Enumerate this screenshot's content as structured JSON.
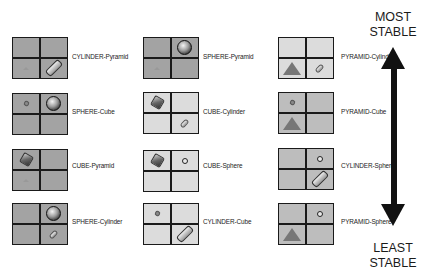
{
  "stability": {
    "top_label_line1": "MOST",
    "top_label_line2": "STABLE",
    "bottom_label_line1": "LEAST",
    "bottom_label_line2": "STABLE"
  },
  "columns": [
    {
      "items": [
        {
          "label": "CYLINDER-Pyramid",
          "theme": "dark",
          "cells": [
            "empty",
            "empty",
            "pyramid-tiny",
            "cylinder"
          ]
        },
        {
          "label": "SPHERE-Cube",
          "theme": "dark",
          "cells": [
            "cube-tiny",
            "sphere",
            "empty",
            "empty"
          ]
        },
        {
          "label": "CUBE-Pyramid",
          "theme": "dark",
          "cells": [
            "cube",
            "empty",
            "pyramid-tiny",
            "empty"
          ]
        },
        {
          "label": "SPHERE-Cylinder",
          "theme": "dark",
          "cells": [
            "empty",
            "sphere",
            "empty",
            "cylinder-tiny"
          ]
        }
      ]
    },
    {
      "items": [
        {
          "label": "SPHERE-Pyramid",
          "theme": "dark",
          "cells": [
            "empty",
            "sphere",
            "pyramid-tiny",
            "empty"
          ]
        },
        {
          "label": "CUBE-Cylinder",
          "theme": "light",
          "cells": [
            "cube",
            "empty",
            "empty",
            "cylinder-tiny"
          ]
        },
        {
          "label": "CUBE-Sphere",
          "theme": "light",
          "cells": [
            "cube",
            "sphere-small",
            "empty",
            "empty"
          ]
        },
        {
          "label": "CYLINDER-Cube",
          "theme": "light",
          "cells": [
            "cube-tiny",
            "empty",
            "empty",
            "cylinder"
          ]
        }
      ]
    },
    {
      "items": [
        {
          "label": "PYRAMID-Cylinder",
          "theme": "light",
          "cells": [
            "empty",
            "empty",
            "pyramid",
            "cylinder-tiny"
          ]
        },
        {
          "label": "PYRAMID-Cube",
          "theme": "mid",
          "cells": [
            "cube-tiny",
            "empty",
            "pyramid",
            "empty"
          ]
        },
        {
          "label": "CYLINDER-Sphere",
          "theme": "mid",
          "cells": [
            "empty",
            "sphere-small",
            "empty",
            "cylinder"
          ]
        },
        {
          "label": "PYRAMID-Sphere",
          "theme": "mid",
          "cells": [
            "empty",
            "sphere-small",
            "pyramid",
            "empty"
          ]
        }
      ]
    }
  ]
}
